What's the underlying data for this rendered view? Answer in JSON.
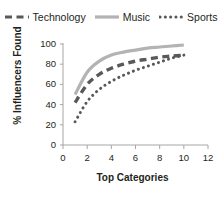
{
  "chart_data": {
    "type": "line",
    "title": "",
    "subtitle": "",
    "xlabel": "Top Categories",
    "ylabel": "% Influencers Found",
    "xlim": [
      0,
      12
    ],
    "ylim": [
      0,
      100
    ],
    "xticks": [
      "0",
      "2",
      "4",
      "6",
      "8",
      "10",
      "12"
    ],
    "yticks": [
      "0",
      "20",
      "40",
      "60",
      "80",
      "100"
    ],
    "grid": false,
    "legend_position": "top",
    "x": [
      1,
      2,
      3,
      4,
      5,
      6,
      7,
      8,
      9,
      10
    ],
    "series": [
      {
        "name": "Technology",
        "style": "dashed",
        "color": "#58595b",
        "values": [
          42,
          60,
          70,
          76,
          80,
          83,
          85,
          87,
          88,
          89
        ]
      },
      {
        "name": "Music",
        "style": "solid",
        "color": "#b3b3b3",
        "values": [
          50,
          72,
          83,
          89,
          92,
          94,
          96,
          97,
          98,
          99
        ]
      },
      {
        "name": "Sports",
        "style": "dotted",
        "color": "#58595b",
        "values": [
          23,
          43,
          55,
          63,
          69,
          74,
          78,
          82,
          86,
          89
        ]
      }
    ]
  },
  "legend": {
    "entries": [
      {
        "label": "Technology",
        "marker": "dashed-line-swatch"
      },
      {
        "label": "Music",
        "marker": "solid-line-swatch"
      },
      {
        "label": "Sports",
        "marker": "dotted-line-swatch"
      }
    ]
  },
  "axes": {
    "y_title": "% Influencers Found",
    "x_title": "Top Categories",
    "y_tick_labels": [
      "100",
      "80",
      "60",
      "40",
      "20",
      "0"
    ],
    "x_tick_labels": [
      "0",
      "2",
      "4",
      "6",
      "8",
      "10",
      "12"
    ]
  },
  "colors": {
    "technology": "#58595b",
    "music": "#b3b3b3",
    "sports": "#58595b",
    "axis": "#a6a6a6",
    "text": "#231f20",
    "background": "#ffffff"
  }
}
